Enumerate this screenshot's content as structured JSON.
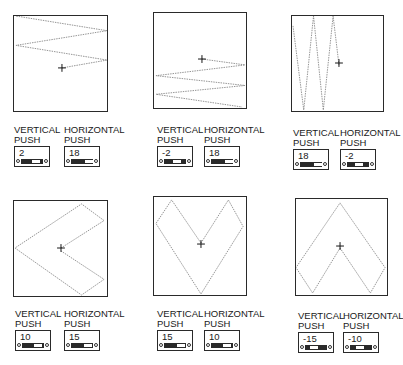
{
  "labels": {
    "vertical": "VERTICAL",
    "horizontal": "HORIZONTAL",
    "push": "PUSH"
  },
  "panels": [
    {
      "id": "panel-1",
      "vertical_push": "2",
      "horizontal_push": "18",
      "path": "M 49 53 L 95 45 L 2 30 L 95 15 L 2 0 L 95 -15"
    },
    {
      "id": "panel-2",
      "vertical_push": "-2",
      "horizontal_push": "18",
      "path": "M 49 47 L 93 53 L 2 64 L 93 74 L 2 83 L 90 96"
    },
    {
      "id": "panel-3",
      "vertical_push": "18",
      "horizontal_push": "-2",
      "path": "M 48 50 L 42 0 L 32 96 L 22 0 L 12 96 L 1 10"
    },
    {
      "id": "panel-4",
      "vertical_push": "10",
      "horizontal_push": "15",
      "path": "M 48 48 L 92 20 L 69 3 L 1 48 L 69 96 L 92 80 L 48 51"
    },
    {
      "id": "panel-5",
      "vertical_push": "15",
      "horizontal_push": "10",
      "path": "M 48 47 L 76 3 L 91 30 L 48 99 L 2 27 L 18 3 L 48 47"
    },
    {
      "id": "panel-6",
      "vertical_push": "-15",
      "horizontal_push": "-10",
      "path": "M 45 50 L 76 96 L 91 70 L 45 4 L 0 70 L 17 96 L 45 50"
    }
  ],
  "colors": {
    "frame": "#2a2a2a",
    "trace": "#777777",
    "crosshair": "#111111"
  }
}
